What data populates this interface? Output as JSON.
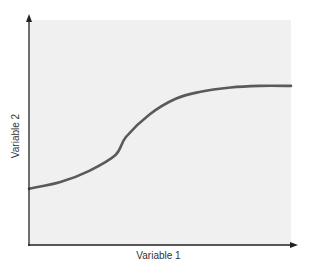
{
  "chart_data": {
    "type": "line",
    "title": "",
    "xlabel": "Variable 1",
    "ylabel": "Variable 2",
    "xlim": [
      0,
      10
    ],
    "ylim": [
      0,
      10
    ],
    "grid": false,
    "legend": null,
    "ticks": {
      "x": [],
      "y": []
    },
    "note": "No tick labels shown; values estimated on an arbitrary 0-10 scale. Sigmoid-shaped curve.",
    "series": [
      {
        "name": "curve",
        "color": "#5a5a5a",
        "x": [
          0,
          1.2,
          2.3,
          3.3,
          3.7,
          4.6,
          5.6,
          6.5,
          7.7,
          8.8,
          10
        ],
        "y": [
          2.5,
          2.8,
          3.3,
          4.0,
          4.8,
          5.8,
          6.5,
          6.8,
          7.0,
          7.07,
          7.07
        ]
      }
    ]
  },
  "colors": {
    "panel_background": "#f0f0f0",
    "axis": "#222222",
    "curve": "#5a5a5a",
    "label": "#333333"
  },
  "labels": {
    "x_axis": "Variable 1",
    "y_axis": "Variable 2"
  }
}
